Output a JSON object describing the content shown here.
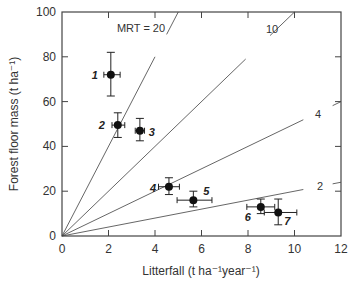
{
  "chart_data": {
    "type": "scatter",
    "title": "",
    "xlabel": "Litterfall (t ha⁻¹year⁻¹)",
    "ylabel": "Forest floor mass (t ha⁻¹)",
    "xlim": [
      0,
      12
    ],
    "ylim": [
      0,
      100
    ],
    "xticks": [
      0,
      2,
      4,
      6,
      8,
      10,
      12
    ],
    "yticks": [
      0,
      20,
      40,
      60,
      80,
      100
    ],
    "grid": false,
    "legend": null,
    "points": [
      {
        "label": "1",
        "x": 2.1,
        "y": 72,
        "xerr": [
          1.8,
          2.5
        ],
        "yerr": [
          62.5,
          82
        ]
      },
      {
        "label": "2",
        "x": 2.4,
        "y": 49.5,
        "xerr": [
          2.15,
          2.7
        ],
        "yerr": [
          44,
          55
        ]
      },
      {
        "label": "3",
        "x": 3.35,
        "y": 47,
        "xerr": [
          3.15,
          3.55
        ],
        "yerr": [
          42.5,
          52.5
        ]
      },
      {
        "label": "4",
        "x": 4.6,
        "y": 22,
        "xerr": [
          4.15,
          5.05
        ],
        "yerr": [
          18.5,
          26
        ]
      },
      {
        "label": "5",
        "x": 5.65,
        "y": 16,
        "xerr": [
          4.95,
          6.45
        ],
        "yerr": [
          13,
          20
        ]
      },
      {
        "label": "6",
        "x": 8.55,
        "y": 13,
        "xerr": [
          7.95,
          9.15
        ],
        "yerr": [
          10,
          16.5
        ]
      },
      {
        "label": "7",
        "x": 9.3,
        "y": 10.5,
        "xerr": [
          8.7,
          10.1
        ],
        "yerr": [
          5,
          16.5
        ]
      }
    ],
    "reference_lines": [
      {
        "label": "MRT = 20",
        "end": [
          5,
          100
        ]
      },
      {
        "label": "10",
        "end": [
          10,
          100
        ]
      },
      {
        "label": "4",
        "end": [
          12,
          60
        ]
      },
      {
        "label": "2",
        "end": [
          12,
          24
        ]
      }
    ],
    "annotations": [
      "MRT = 20",
      "10",
      "4",
      "2"
    ]
  }
}
